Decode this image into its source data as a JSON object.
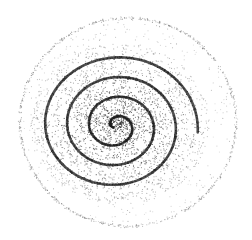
{
  "image": {
    "subject": "stippled spiral",
    "description": "Hand-drawn style stipple illustration of a clockwise spiral with dense dotted fill fading outward to a faint outer ring",
    "background_color": "#ffffff",
    "ink_color": "#2a2a2a",
    "width": 252,
    "height": 240
  },
  "spiral": {
    "center": [
      116,
      126
    ],
    "turns": 3.6,
    "start_radius": 3,
    "end_radius": 82,
    "stroke_color": "#333333",
    "stroke_width": 2.6
  },
  "outer_ring": {
    "center": [
      128,
      122
    ],
    "rx": 108,
    "ry": 104,
    "dot_color": "#7a7a7a"
  },
  "stipple": {
    "inner_dots": 2600,
    "ring_dots": 700,
    "scatter_dots": 220,
    "dot_color": "#3a3a3a"
  }
}
